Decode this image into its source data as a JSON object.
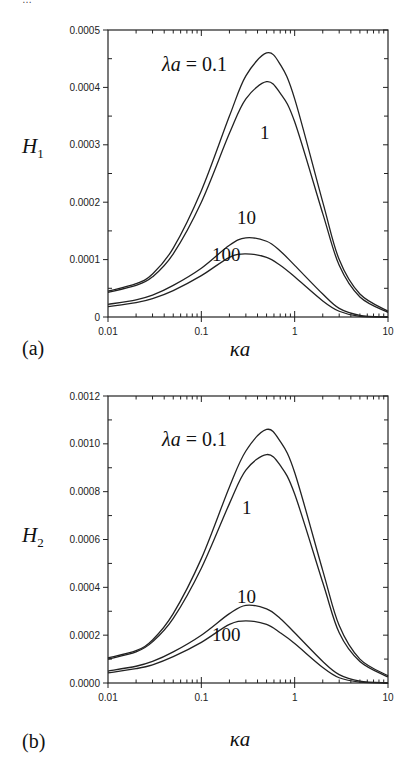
{
  "header_fragment": "…",
  "chart_data": [
    {
      "type": "line",
      "panel_label": "(a)",
      "title": "",
      "xlabel": "κa",
      "ylabel": "H",
      "ylabel_sub": "1",
      "xscale": "log",
      "xlim": [
        0.01,
        10
      ],
      "ylim": [
        0,
        0.0005
      ],
      "xticks": [
        "0.01",
        "0.1",
        "1",
        "10"
      ],
      "yticks": [
        "0",
        "0.0001",
        "0.0002",
        "0.0003",
        "0.0004",
        "0.0005"
      ],
      "grid": false,
      "legend": "inline labels",
      "x": [
        0.01,
        0.02,
        0.03,
        0.05,
        0.1,
        0.2,
        0.3,
        0.5,
        0.7,
        1,
        2,
        3,
        5,
        10
      ],
      "series": [
        {
          "name": "λa = 0.1",
          "label": "λa = 0.1",
          "values": [
            4.5e-05,
            5.8e-05,
            7.5e-05,
            0.00012,
            0.00022,
            0.00035,
            0.00042,
            0.00046,
            0.00044,
            0.00038,
            0.0002,
            0.0001,
            4e-05,
            1e-05
          ]
        },
        {
          "name": "λa = 1",
          "label": "1",
          "values": [
            4.3e-05,
            5.5e-05,
            7e-05,
            0.00011,
            0.0002,
            0.00032,
            0.00038,
            0.00041,
            0.00039,
            0.00034,
            0.00018,
            9e-05,
            3.5e-05,
            8e-06
          ]
        },
        {
          "name": "λa = 10",
          "label": "10",
          "values": [
            2.2e-05,
            3e-05,
            3.8e-05,
            5.5e-05,
            8.5e-05,
            0.000125,
            0.000138,
            0.000132,
            0.000115,
            9e-05,
            4e-05,
            1.5e-05,
            3e-06,
            0.0
          ]
        },
        {
          "name": "λa = 100",
          "label": "100",
          "values": [
            1.8e-05,
            2.5e-05,
            3.2e-05,
            4.6e-05,
            7.2e-05,
            0.000104,
            0.00011,
            0.000104,
            9e-05,
            7e-05,
            2.8e-05,
            1e-05,
            1e-06,
            0.0
          ]
        }
      ]
    },
    {
      "type": "line",
      "panel_label": "(b)",
      "title": "",
      "xlabel": "κa",
      "ylabel": "H",
      "ylabel_sub": "2",
      "xscale": "log",
      "xlim": [
        0.01,
        10
      ],
      "ylim": [
        0,
        0.0012
      ],
      "xticks": [
        "0.01",
        "0.1",
        "1",
        "10"
      ],
      "yticks": [
        "0.0000",
        "0.0002",
        "0.0004",
        "0.0006",
        "0.0008",
        "0.0010",
        "0.0012"
      ],
      "grid": false,
      "legend": "inline labels",
      "x": [
        0.01,
        0.02,
        0.03,
        0.05,
        0.1,
        0.2,
        0.3,
        0.5,
        0.7,
        1,
        2,
        3,
        5,
        10
      ],
      "series": [
        {
          "name": "λa = 0.1",
          "label": "λa = 0.1",
          "values": [
            0.000105,
            0.000135,
            0.00018,
            0.00029,
            0.00052,
            0.00082,
            0.00097,
            0.00106,
            0.00101,
            0.00088,
            0.00047,
            0.00024,
            0.0001,
            3e-05
          ]
        },
        {
          "name": "λa = 1",
          "label": "1",
          "values": [
            0.0001,
            0.00013,
            0.000172,
            0.00027,
            0.00048,
            0.00075,
            0.00089,
            0.000955,
            0.00091,
            0.00079,
            0.00042,
            0.00021,
            9e-05,
            2.5e-05
          ]
        },
        {
          "name": "λa = 10",
          "label": "10",
          "values": [
            5e-05,
            7e-05,
            9e-05,
            0.00013,
            0.0002,
            0.00029,
            0.000325,
            0.00031,
            0.00027,
            0.00021,
            9e-05,
            3.5e-05,
            8e-06,
            0.0
          ]
        },
        {
          "name": "λa = 100",
          "label": "100",
          "values": [
            4.2e-05,
            6e-05,
            7.6e-05,
            0.00011,
            0.00017,
            0.000245,
            0.00026,
            0.000245,
            0.00021,
            0.000165,
            6.5e-05,
            2.2e-05,
            4e-06,
            0.0
          ]
        }
      ]
    }
  ],
  "layout": [
    {
      "left": 108,
      "right": 388,
      "top": 30,
      "bottom": 317,
      "panel_label_pos": [
        22,
        355
      ],
      "ylabel_pos": [
        22,
        153
      ],
      "xlabel_pos": [
        240,
        356
      ],
      "label_pos": [
        [
          162,
          71
        ],
        [
          260,
          139
        ],
        [
          237,
          224
        ],
        [
          212,
          261
        ]
      ]
    },
    {
      "left": 108,
      "right": 388,
      "top": 396,
      "bottom": 683,
      "panel_label_pos": [
        22,
        748
      ],
      "ylabel_pos": [
        22,
        542
      ],
      "xlabel_pos": [
        240,
        746
      ],
      "label_pos": [
        [
          162,
          446
        ],
        [
          242,
          514
        ],
        [
          237,
          603
        ],
        [
          212,
          641
        ]
      ]
    }
  ]
}
